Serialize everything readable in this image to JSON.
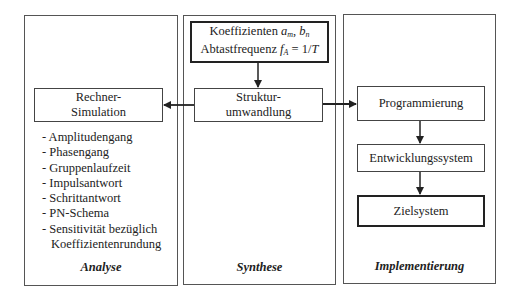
{
  "panels": {
    "analyse": {
      "caption": "Analyse",
      "box": {
        "line1": "Rechner-",
        "line2": "Simulation"
      },
      "items": [
        "- Amplitudengang",
        "- Phasengang",
        "- Gruppenlaufzeit",
        "- Impulsantwort",
        "- Schrittantwort",
        "- PN-Schema",
        "- Sensitivität bezüglich"
      ],
      "item_continuation": "Koeffizientenrundung"
    },
    "synthese": {
      "caption": "Synthese",
      "input_box": {
        "line1_text": "Koeffizienten ",
        "line1_math_a": "a",
        "line1_math_a_sub": "m",
        "line1_sep": ", ",
        "line1_math_b": "b",
        "line1_math_b_sub": "n",
        "line2_text": "Abtastfrequenz ",
        "line2_math_f": "f",
        "line2_math_f_sub": "A",
        "line2_eq": " = 1/",
        "line2_math_T": "T"
      },
      "box": {
        "line1": "Struktur-",
        "line2": "umwandlung"
      }
    },
    "implementierung": {
      "caption": "Implementierung",
      "boxes": [
        "Programmierung",
        "Entwicklungssystem",
        "Zielsystem"
      ]
    }
  },
  "colors": {
    "line": "#222222",
    "panel_border": "#555555",
    "background": "#ffffff"
  }
}
